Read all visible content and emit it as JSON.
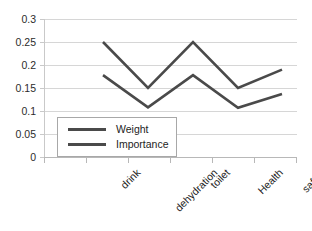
{
  "chart_data": {
    "type": "line",
    "title": "",
    "xlabel": "",
    "ylabel": "",
    "categories": [
      "drink",
      "dehydration",
      "toilet",
      "Health",
      "safety"
    ],
    "series": [
      {
        "name": "Weight",
        "values": [
          0.178,
          0.108,
          0.178,
          0.107,
          0.137
        ],
        "color": "#4a4a4a"
      },
      {
        "name": "Importance",
        "values": [
          0.25,
          0.15,
          0.25,
          0.15,
          0.19
        ],
        "color": "#4a4a4a"
      }
    ],
    "ylim": [
      0,
      0.3
    ],
    "ytick_labels": [
      "0.3",
      "0.25",
      "0.2",
      "0.15",
      "0.1",
      "0.05",
      "0"
    ],
    "ytick_values": [
      0.3,
      0.25,
      0.2,
      0.15,
      0.1,
      0.05,
      0
    ],
    "grid": true,
    "grid_color": "#d6d6d6",
    "legend_position": "inside-lower-left",
    "axis_color": "#c9c9c9",
    "background": "#ffffff"
  },
  "legend": {
    "items": [
      {
        "label": "Weight"
      },
      {
        "label": "Importance"
      }
    ]
  }
}
